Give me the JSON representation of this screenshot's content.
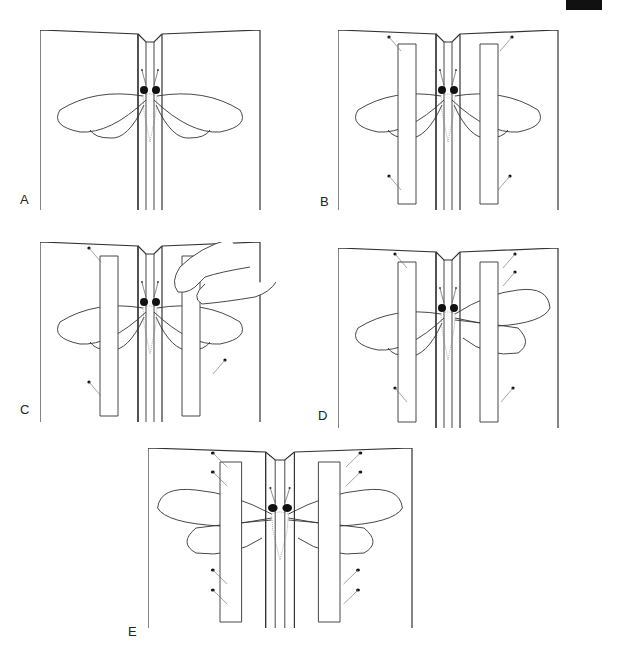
{
  "figure": {
    "panels": [
      {
        "id": "A",
        "label": "A",
        "step": "insect placed in groove of spreading board, wings free"
      },
      {
        "id": "B",
        "label": "B",
        "step": "paper strips pinned over both wing sets"
      },
      {
        "id": "C",
        "label": "C",
        "step": "finger lifts strip to adjust wing position"
      },
      {
        "id": "D",
        "label": "D",
        "step": "right wings pulled forward and pinned with strip"
      },
      {
        "id": "E",
        "label": "E",
        "step": "both wing pairs spread and pinned symmetrically"
      }
    ]
  },
  "colors": {
    "line": "#333333",
    "background": "#ffffff",
    "mark": "#111111"
  }
}
